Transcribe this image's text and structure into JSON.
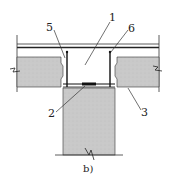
{
  "figure": {
    "caption": "b)",
    "labels": [
      {
        "id": "5",
        "text": "5"
      },
      {
        "id": "1",
        "text": "1"
      },
      {
        "id": "6",
        "text": "6"
      },
      {
        "id": "2",
        "text": "2"
      },
      {
        "id": "3",
        "text": "3"
      }
    ]
  },
  "colors": {
    "concrete_fill": "#c8c8c8",
    "line": "#222222",
    "background": "#ffffff"
  }
}
